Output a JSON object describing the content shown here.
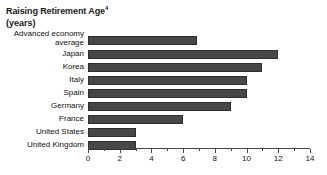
{
  "chart_data": {
    "type": "bar",
    "orientation": "horizontal",
    "title": "Raising Retirement Age",
    "title_superscript": "4",
    "subtitle": "(years)",
    "xlabel": "",
    "ylabel": "",
    "xlim": [
      0,
      14
    ],
    "xticks": [
      0,
      2,
      4,
      6,
      8,
      10,
      12,
      14
    ],
    "xtick_labels": [
      "0",
      "2",
      "4",
      "6",
      "8",
      "10",
      "12",
      "14"
    ],
    "minor_tick_step": 1,
    "grid": false,
    "legend": false,
    "bar_color": "#474747",
    "categories": [
      "Advanced economy average",
      "Japan",
      "Korea",
      "Italy",
      "Spain",
      "Germany",
      "France",
      "United States",
      "United Kingdom"
    ],
    "values": [
      6.9,
      12.0,
      11.0,
      10.0,
      10.0,
      9.0,
      6.0,
      3.0,
      3.0
    ]
  }
}
